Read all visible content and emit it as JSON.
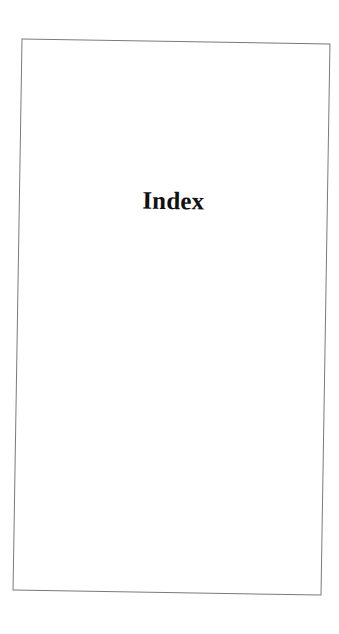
{
  "document": {
    "heading": "Index"
  }
}
